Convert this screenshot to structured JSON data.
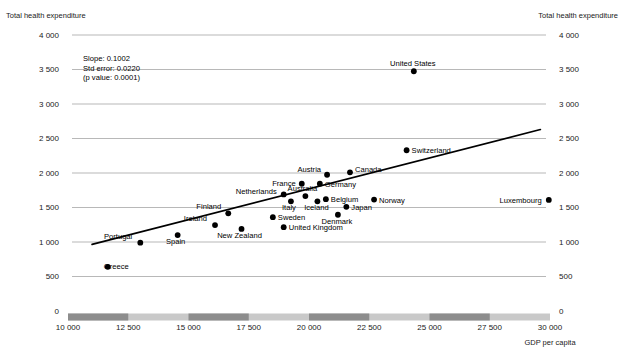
{
  "chart_data": {
    "type": "scatter",
    "title": "",
    "xlabel": "GDP per capita",
    "ylabel_left": "Total health expenditure",
    "ylabel_right": "Total health expenditure",
    "xlim": [
      10000,
      30000
    ],
    "ylim": [
      0,
      4000
    ],
    "xticks": [
      10000,
      12500,
      15000,
      17500,
      20000,
      22500,
      25000,
      27500,
      30000
    ],
    "xtick_labels": [
      "10 000",
      "12 500",
      "15 000",
      "17 500",
      "20 000",
      "22 500",
      "25 000",
      "27 500",
      "30 000"
    ],
    "yticks": [
      0,
      500,
      1000,
      1500,
      2000,
      2500,
      3000,
      3500,
      4000
    ],
    "ytick_labels": [
      "0",
      "500",
      "1 000",
      "1 500",
      "2 000",
      "2 500",
      "3 000",
      "3 500",
      "4 000"
    ],
    "grid": true,
    "legend": "none",
    "annotations": {
      "slope_label": "Slope:  0.1002",
      "std_error_label": "Std error:  0.0220",
      "p_value_label": "(p value:  0.0001)"
    },
    "regression": {
      "slope": 0.1002,
      "std_error": 0.022,
      "p_value": 0.0001,
      "x_start": 11000,
      "y_start": 965,
      "x_end": 29600,
      "y_end": 2630
    },
    "points": [
      {
        "label": "Greece",
        "x": 11650,
        "y": 640,
        "lx": -4,
        "ly": 2.6,
        "anchor": "start"
      },
      {
        "label": "Portugal",
        "x": 13000,
        "y": 990,
        "lx": -8,
        "ly": -4,
        "anchor": "end"
      },
      {
        "label": "Spain",
        "x": 14550,
        "y": 1100,
        "lx": -2,
        "ly": 9,
        "anchor": "middle"
      },
      {
        "label": "Ireland",
        "x": 16100,
        "y": 1245,
        "lx": -8,
        "ly": -4,
        "anchor": "end"
      },
      {
        "label": "Finland",
        "x": 16650,
        "y": 1415,
        "lx": -7,
        "ly": -4,
        "anchor": "end"
      },
      {
        "label": "New Zealand",
        "x": 17200,
        "y": 1190,
        "lx": -2,
        "ly": 9,
        "anchor": "middle"
      },
      {
        "label": "Sweden",
        "x": 18500,
        "y": 1360,
        "lx": 5,
        "ly": 2.6,
        "anchor": "start"
      },
      {
        "label": "United Kingdom",
        "x": 18950,
        "y": 1215,
        "lx": 5,
        "ly": 2.6,
        "anchor": "start"
      },
      {
        "label": "Netherlands",
        "x": 18950,
        "y": 1690,
        "lx": -7,
        "ly": -0.5,
        "anchor": "end"
      },
      {
        "label": "Italy",
        "x": 19250,
        "y": 1590,
        "lx": -2,
        "ly": 9,
        "anchor": "middle"
      },
      {
        "label": "France",
        "x": 19700,
        "y": 1845,
        "lx": -6,
        "ly": 2.4,
        "anchor": "end"
      },
      {
        "label": "Australia",
        "x": 19850,
        "y": 1665,
        "lx": -3,
        "ly": -5,
        "anchor": "middle"
      },
      {
        "label": "Iceland",
        "x": 20350,
        "y": 1590,
        "lx": -1,
        "ly": 9,
        "anchor": "middle"
      },
      {
        "label": "Germany",
        "x": 20450,
        "y": 1845,
        "lx": 5,
        "ly": 3,
        "anchor": "start"
      },
      {
        "label": "Austria",
        "x": 20750,
        "y": 1975,
        "lx": -6,
        "ly": -3,
        "anchor": "end"
      },
      {
        "label": "Belgium",
        "x": 20700,
        "y": 1620,
        "lx": 5,
        "ly": 3,
        "anchor": "start"
      },
      {
        "label": "Denmark",
        "x": 21200,
        "y": 1395,
        "lx": -1,
        "ly": 9.5,
        "anchor": "middle"
      },
      {
        "label": "Japan",
        "x": 21550,
        "y": 1510,
        "lx": 5,
        "ly": 3,
        "anchor": "start"
      },
      {
        "label": "Canada",
        "x": 21700,
        "y": 2010,
        "lx": 5,
        "ly": 0,
        "anchor": "start"
      },
      {
        "label": "Norway",
        "x": 22700,
        "y": 1615,
        "lx": 5,
        "ly": 3,
        "anchor": "start"
      },
      {
        "label": "Switzerland",
        "x": 24050,
        "y": 2330,
        "lx": 5,
        "ly": 2.6,
        "anchor": "start"
      },
      {
        "label": "United States",
        "x": 24350,
        "y": 3475,
        "lx": -1,
        "ly": -5,
        "anchor": "middle"
      },
      {
        "label": "Luxembourg",
        "x": 29950,
        "y": 1610,
        "lx": -7,
        "ly": 2.6,
        "anchor": "end"
      }
    ]
  }
}
